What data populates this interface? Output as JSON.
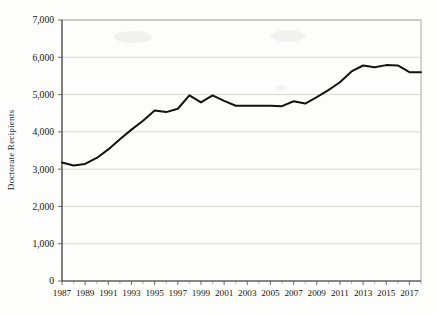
{
  "chart_data": {
    "type": "line",
    "title": "",
    "xlabel": "",
    "ylabel": "Doctorate Recipients",
    "x": [
      1987,
      1988,
      1989,
      1990,
      1991,
      1992,
      1993,
      1994,
      1995,
      1996,
      1997,
      1998,
      1999,
      2000,
      2001,
      2002,
      2003,
      2004,
      2005,
      2006,
      2007,
      2008,
      2009,
      2010,
      2011,
      2012,
      2013,
      2014,
      2015,
      2016,
      2017,
      2018
    ],
    "values": [
      3180,
      3100,
      3140,
      3300,
      3530,
      3800,
      4060,
      4300,
      4570,
      4530,
      4620,
      4980,
      4790,
      4980,
      4830,
      4700,
      4700,
      4700,
      4700,
      4690,
      4820,
      4760,
      4930,
      5120,
      5330,
      5620,
      5780,
      5730,
      5790,
      5780,
      5600,
      5600
    ],
    "series": [
      {
        "name": "Doctorate Recipients",
        "values": [
          3180,
          3100,
          3140,
          3300,
          3530,
          3800,
          4060,
          4300,
          4570,
          4530,
          4620,
          4980,
          4790,
          4980,
          4830,
          4700,
          4700,
          4700,
          4700,
          4690,
          4820,
          4760,
          4930,
          5120,
          5330,
          5620,
          5780,
          5730,
          5790,
          5780,
          5600,
          5600
        ],
        "color": "#121210"
      }
    ],
    "ylim": [
      0,
      7000
    ],
    "xlim": [
      1987,
      2018
    ],
    "yticks": [
      0,
      1000,
      2000,
      3000,
      4000,
      5000,
      6000,
      7000
    ],
    "ytick_labels": [
      "0",
      "1,000",
      "2,000",
      "3,000",
      "4,000",
      "5,000",
      "6,000",
      "7,000"
    ],
    "xticks": [
      1987,
      1989,
      1991,
      1993,
      1995,
      1997,
      1999,
      2001,
      2003,
      2005,
      2007,
      2009,
      2011,
      2013,
      2015,
      2017
    ],
    "xtick_labels": [
      "1987",
      "1989",
      "1991",
      "1993",
      "1995",
      "1997",
      "1999",
      "2001",
      "2003",
      "2005",
      "2007",
      "2009",
      "2011",
      "2013",
      "2015",
      "2017"
    ],
    "grid": true,
    "grid_axis": "y",
    "legend": false,
    "legend_position": "none",
    "annotations": []
  },
  "colors": {
    "background": "#fdfdfb",
    "line": "#121210",
    "gridline": "#cfcfc9",
    "axis": "#3a3a36",
    "text": "#16160f"
  }
}
